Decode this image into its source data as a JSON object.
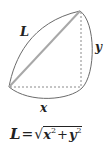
{
  "diagram": {
    "labels": {
      "hypotenuse": "L",
      "vertical_leg": "y",
      "horizontal_leg": "x"
    },
    "colors": {
      "curve": "#6b6b6b",
      "diagonal": "#a8a8a8",
      "dotted": "#8a8a8a",
      "text": "#222222"
    }
  },
  "formula": {
    "lhs": "L",
    "equals": "=",
    "radical": "√",
    "term1_base": "x",
    "term1_exp": "2",
    "plus": "+",
    "term2_base": "y",
    "term2_exp": "2"
  }
}
